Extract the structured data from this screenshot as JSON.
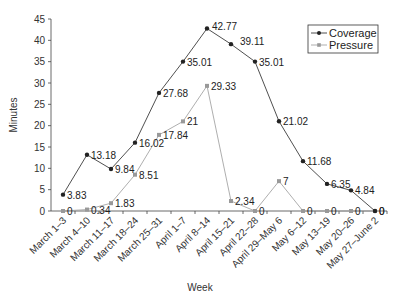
{
  "chart_data": {
    "type": "line",
    "title": "",
    "xlabel": "Week",
    "ylabel": "Minutes",
    "ylim": [
      0,
      45
    ],
    "yticks": [
      0,
      5,
      10,
      15,
      20,
      25,
      30,
      35,
      40,
      45
    ],
    "grid": false,
    "legend_position": "top-right",
    "categories": [
      "March 1–3",
      "March 4–10",
      "March 11–17",
      "March 18–24",
      "March 25–31",
      "April 1–7",
      "April 8–14",
      "April 15–21",
      "April 22–28",
      "April 29–May 6",
      "May 6–12",
      "May 13–19",
      "May 20–26",
      "May 27–June 2"
    ],
    "series": [
      {
        "name": "Coverage",
        "color": "#222222",
        "marker": "circle",
        "values": [
          3.83,
          13.18,
          9.84,
          16.02,
          27.68,
          35.01,
          42.77,
          39.11,
          35.01,
          21.02,
          11.68,
          6.35,
          4.84,
          0
        ],
        "labels": [
          "3.83",
          "13.18",
          "9.84",
          "16.02",
          "27.68",
          "35.01",
          "42.77",
          "39.11",
          "35.01",
          "21.02",
          "11.68",
          "6.35",
          "4.84",
          "0"
        ]
      },
      {
        "name": "Pressure",
        "color": "#999999",
        "marker": "square",
        "values": [
          0,
          0.34,
          1.83,
          8.51,
          17.84,
          21,
          29.33,
          2.34,
          0,
          7,
          0,
          0,
          0,
          0
        ],
        "labels": [
          "0",
          "0.34",
          "1.83",
          "8.51",
          "17.84",
          "21",
          "29.33",
          "2.34",
          "0",
          "7",
          "0",
          "0",
          "0",
          "0"
        ]
      }
    ]
  }
}
